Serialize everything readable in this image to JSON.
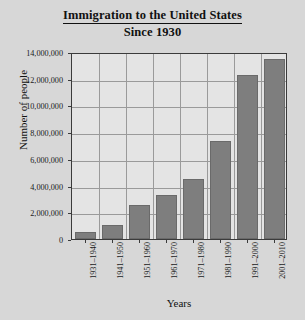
{
  "chart_data": {
    "type": "bar",
    "title": "Immigration to the United States Since 1930",
    "title_line_1": "Immigration to the United States",
    "title_line_2": "Since 1930",
    "xlabel": "Years",
    "ylabel": "Number of people",
    "categories": [
      "1931–1940",
      "1941–1950",
      "1951–1960",
      "1961–1970",
      "1971–1980",
      "1981–1990",
      "1991–2000",
      "2001–2010"
    ],
    "values": [
      528000,
      1035000,
      2515000,
      3322000,
      4493000,
      7338000,
      12300000,
      13500000
    ],
    "value_labels": [
      "528,000",
      "1,035,000",
      "2,515,000",
      "3,322,000",
      "4,493,000",
      "7,338,000",
      "12,300,000",
      "13,500,000"
    ],
    "ylim": [
      0,
      14000000
    ],
    "ytick_values": [
      0,
      2000000,
      4000000,
      6000000,
      8000000,
      10000000,
      12000000,
      14000000
    ],
    "ytick_labels": [
      "0",
      "2,000,000",
      "4,000,000",
      "6,000,000",
      "8,000,000",
      "10,000,000",
      "12,000,000",
      "14,000,000"
    ],
    "grid": true,
    "legend": false,
    "bar_color": "#7e7e7e",
    "plot_background": "#e4e4e4",
    "page_background": "#d7d7d7",
    "axis_color": "#3b3b3b",
    "gridline_color": "#9a9a9a"
  }
}
